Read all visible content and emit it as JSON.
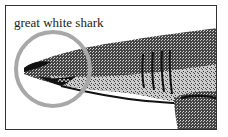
{
  "illustration": {
    "label": "great white shark",
    "subject": "shark-head-engraving",
    "highlight": "snout-circle",
    "colors": {
      "ink": "#111111",
      "circle": "#a8a8a8",
      "frame": "#333333"
    }
  }
}
